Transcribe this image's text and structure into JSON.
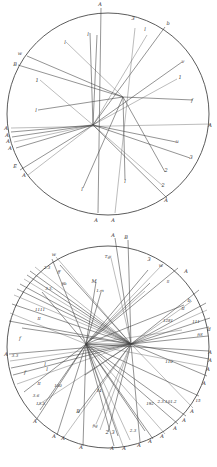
{
  "figure": {
    "width": 217,
    "height": 467,
    "colors": {
      "background": "#ffffff",
      "ink": "#3a3a3a",
      "circle": "#4a4a4a"
    }
  },
  "diagrams": [
    {
      "id": "upper-circle",
      "circle": {
        "cx": 108,
        "cy": 114,
        "r": 101
      },
      "foci": [
        {
          "x": 93,
          "y": 125
        },
        {
          "x": 123,
          "y": 97
        }
      ],
      "chords": [
        [
          101,
          8,
          98,
          213
        ],
        [
          90,
          33,
          93,
          125
        ],
        [
          93,
          125,
          147,
          35
        ],
        [
          93,
          125,
          165,
          27
        ],
        [
          93,
          125,
          182,
          62
        ],
        [
          93,
          125,
          177,
          79
        ],
        [
          27,
          56,
          123,
          97
        ],
        [
          18,
          65,
          123,
          97
        ],
        [
          40,
          80,
          93,
          125
        ],
        [
          38,
          110,
          123,
          97
        ],
        [
          123,
          97,
          193,
          100
        ],
        [
          66,
          42,
          123,
          97
        ],
        [
          123,
          97,
          165,
          172
        ],
        [
          123,
          97,
          125,
          180
        ],
        [
          11,
          128,
          211,
          124
        ],
        [
          11,
          132,
          93,
          125
        ],
        [
          12,
          137,
          93,
          125
        ],
        [
          14,
          142,
          93,
          125
        ],
        [
          16,
          148,
          93,
          125
        ],
        [
          20,
          170,
          93,
          125
        ],
        [
          28,
          175,
          93,
          125
        ],
        [
          93,
          125,
          176,
          142
        ],
        [
          93,
          125,
          190,
          158
        ],
        [
          93,
          125,
          163,
          186
        ],
        [
          93,
          125,
          167,
          198
        ],
        [
          83,
          188,
          123,
          97
        ],
        [
          115,
          213,
          135,
          28
        ],
        [
          93,
          125,
          97,
          35
        ]
      ],
      "labels": [
        {
          "text": "A",
          "x": 100,
          "y": 6
        },
        {
          "text": "3",
          "x": 133,
          "y": 20
        },
        {
          "text": "b",
          "x": 168,
          "y": 25
        },
        {
          "text": "l",
          "x": 88,
          "y": 36
        },
        {
          "text": "l",
          "x": 145,
          "y": 31
        },
        {
          "text": "l",
          "x": 65,
          "y": 44
        },
        {
          "text": "w",
          "x": 20,
          "y": 55
        },
        {
          "text": "B",
          "x": 15,
          "y": 66
        },
        {
          "text": "1",
          "x": 37,
          "y": 82
        },
        {
          "text": "v",
          "x": 183,
          "y": 63
        },
        {
          "text": "1",
          "x": 180,
          "y": 79
        },
        {
          "text": "l",
          "x": 36,
          "y": 112
        },
        {
          "text": "f",
          "x": 192,
          "y": 102
        },
        {
          "text": "A",
          "x": 6,
          "y": 130
        },
        {
          "text": "A",
          "x": 210,
          "y": 127
        },
        {
          "text": "A",
          "x": 7,
          "y": 137
        },
        {
          "text": "A",
          "x": 8,
          "y": 143
        },
        {
          "text": "A",
          "x": 10,
          "y": 150
        },
        {
          "text": "u",
          "x": 177,
          "y": 143
        },
        {
          "text": "3",
          "x": 191,
          "y": 159
        },
        {
          "text": "E",
          "x": 15,
          "y": 168
        },
        {
          "text": "A",
          "x": 24,
          "y": 177
        },
        {
          "text": "2",
          "x": 166,
          "y": 172
        },
        {
          "text": "l",
          "x": 125,
          "y": 183
        },
        {
          "text": "2",
          "x": 163,
          "y": 187
        },
        {
          "text": "l",
          "x": 82,
          "y": 191
        },
        {
          "text": "A",
          "x": 166,
          "y": 202
        },
        {
          "text": "A",
          "x": 96,
          "y": 222
        },
        {
          "text": "A",
          "x": 113,
          "y": 222
        }
      ]
    },
    {
      "id": "lower-circle",
      "circle": {
        "cx": 108,
        "cy": 347,
        "r": 101
      },
      "foci": [
        {
          "x": 86,
          "y": 344
        },
        {
          "x": 131,
          "y": 344
        }
      ],
      "chords": [
        [
          115,
          238,
          131,
          344
        ],
        [
          128,
          240,
          131,
          344
        ],
        [
          56,
          257,
          131,
          344
        ],
        [
          52,
          259,
          86,
          344
        ],
        [
          60,
          265,
          131,
          344
        ],
        [
          35,
          267,
          131,
          344
        ],
        [
          30,
          271,
          131,
          344
        ],
        [
          27,
          275,
          131,
          344
        ],
        [
          24,
          279,
          131,
          344
        ],
        [
          20,
          284,
          131,
          344
        ],
        [
          17,
          289,
          131,
          344
        ],
        [
          14,
          295,
          131,
          344
        ],
        [
          42,
          292,
          86,
          344
        ],
        [
          12,
          304,
          131,
          344
        ],
        [
          10,
          313,
          86,
          344
        ],
        [
          9,
          321,
          131,
          344
        ],
        [
          22,
          328,
          131,
          344
        ],
        [
          111,
          258,
          131,
          344
        ],
        [
          96,
          282,
          86,
          344
        ],
        [
          101,
          292,
          86,
          344
        ],
        [
          163,
          264,
          86,
          344
        ],
        [
          148,
          270,
          86,
          344
        ],
        [
          150,
          283,
          86,
          344
        ],
        [
          145,
          291,
          86,
          344
        ],
        [
          178,
          268,
          86,
          344
        ],
        [
          199,
          290,
          131,
          344
        ],
        [
          192,
          301,
          131,
          344
        ],
        [
          184,
          305,
          86,
          344
        ],
        [
          206,
          303,
          131,
          344
        ],
        [
          207,
          310,
          131,
          344
        ],
        [
          210,
          318,
          131,
          344
        ],
        [
          209,
          327,
          131,
          344
        ],
        [
          182,
          330,
          86,
          344
        ],
        [
          208,
          336,
          131,
          344
        ],
        [
          9,
          354,
          131,
          344
        ],
        [
          10,
          361,
          131,
          344
        ],
        [
          11,
          368,
          131,
          344
        ],
        [
          13,
          375,
          131,
          344
        ],
        [
          17,
          384,
          131,
          344
        ],
        [
          24,
          392,
          86,
          344
        ],
        [
          40,
          410,
          86,
          344
        ],
        [
          38,
          405,
          131,
          344
        ],
        [
          36,
          420,
          86,
          344
        ],
        [
          57,
          435,
          86,
          344
        ],
        [
          64,
          437,
          131,
          344
        ],
        [
          83,
          446,
          86,
          344
        ],
        [
          114,
          446,
          86,
          344
        ],
        [
          123,
          446,
          86,
          344
        ],
        [
          140,
          442,
          131,
          344
        ],
        [
          153,
          439,
          86,
          344
        ],
        [
          165,
          434,
          86,
          344
        ],
        [
          178,
          424,
          86,
          344
        ],
        [
          186,
          416,
          86,
          344
        ],
        [
          193,
          408,
          131,
          344
        ],
        [
          199,
          396,
          86,
          344
        ],
        [
          207,
          376,
          131,
          344
        ],
        [
          208,
          367,
          86,
          344
        ],
        [
          209,
          359,
          131,
          344
        ],
        [
          209,
          351,
          86,
          344
        ],
        [
          96,
          424,
          131,
          344
        ],
        [
          78,
          413,
          131,
          344
        ],
        [
          108,
          432,
          131,
          344
        ],
        [
          130,
          440,
          86,
          344
        ],
        [
          145,
          431,
          86,
          344
        ],
        [
          85,
          375,
          131,
          344
        ],
        [
          100,
          430,
          131,
          344
        ],
        [
          118,
          436,
          86,
          344
        ],
        [
          86,
          344,
          131,
          344
        ]
      ],
      "labels": [
        {
          "text": "A",
          "x": 113,
          "y": 237
        },
        {
          "text": "B",
          "x": 126,
          "y": 239
        },
        {
          "text": "w",
          "x": 54,
          "y": 256
        },
        {
          "text": "Tgi",
          "x": 108,
          "y": 258,
          "small": true
        },
        {
          "text": "2.3",
          "x": 47,
          "y": 269,
          "small": true
        },
        {
          "text": "ff",
          "x": 59,
          "y": 273,
          "small": true
        },
        {
          "text": "3",
          "x": 149,
          "y": 261
        },
        {
          "text": "w",
          "x": 161,
          "y": 267
        },
        {
          "text": "A",
          "x": 186,
          "y": 273
        },
        {
          "text": "fib",
          "x": 64,
          "y": 285,
          "small": true
        },
        {
          "text": "M",
          "x": 94,
          "y": 283
        },
        {
          "text": "3.3.",
          "x": 49,
          "y": 290,
          "small": true
        },
        {
          "text": "ll",
          "x": 168,
          "y": 283,
          "small": true
        },
        {
          "text": "1.m",
          "x": 100,
          "y": 292,
          "small": true
        },
        {
          "text": "b",
          "x": 189,
          "y": 302
        },
        {
          "text": "1111",
          "x": 40,
          "y": 311,
          "small": true
        },
        {
          "text": "II",
          "x": 183,
          "y": 310,
          "small": true
        },
        {
          "text": "II",
          "x": 39,
          "y": 320,
          "small": true
        },
        {
          "text": "1281",
          "x": 168,
          "y": 322,
          "small": true
        },
        {
          "text": "111",
          "x": 196,
          "y": 323,
          "small": true
        },
        {
          "text": "f",
          "x": 20,
          "y": 340
        },
        {
          "text": "d",
          "x": 209,
          "y": 331
        },
        {
          "text": "fiS",
          "x": 200,
          "y": 336,
          "small": true
        },
        {
          "text": "A",
          "x": 6,
          "y": 356
        },
        {
          "text": "3.3",
          "x": 15,
          "y": 357,
          "small": true
        },
        {
          "text": "l",
          "x": 45,
          "y": 366
        },
        {
          "text": "l",
          "x": 47,
          "y": 371
        },
        {
          "text": "f",
          "x": 25,
          "y": 374
        },
        {
          "text": "110",
          "x": 169,
          "y": 363,
          "small": true
        },
        {
          "text": "II",
          "x": 39,
          "y": 385,
          "small": true
        },
        {
          "text": "100",
          "x": 58,
          "y": 387,
          "small": true
        },
        {
          "text": "3.6",
          "x": 36,
          "y": 397,
          "small": true
        },
        {
          "text": "14",
          "x": 99,
          "y": 392,
          "small": true
        },
        {
          "text": "13.3.",
          "x": 41,
          "y": 405,
          "small": true
        },
        {
          "text": "192",
          "x": 150,
          "y": 405,
          "small": true
        },
        {
          "text": "2.3.101.2",
          "x": 167,
          "y": 403,
          "small": true
        },
        {
          "text": "B",
          "x": 78,
          "y": 413
        },
        {
          "text": "fig",
          "x": 95,
          "y": 427,
          "small": true
        },
        {
          "text": "2",
          "x": 107,
          "y": 434
        },
        {
          "text": "3",
          "x": 113,
          "y": 434
        },
        {
          "text": "2.3",
          "x": 133,
          "y": 432,
          "small": true
        },
        {
          "text": "A",
          "x": 35,
          "y": 423
        },
        {
          "text": "A",
          "x": 54,
          "y": 438
        },
        {
          "text": "A",
          "x": 63,
          "y": 440
        },
        {
          "text": "A",
          "x": 81,
          "y": 449
        },
        {
          "text": "A",
          "x": 112,
          "y": 450
        },
        {
          "text": "A",
          "x": 124,
          "y": 450
        },
        {
          "text": "A",
          "x": 139,
          "y": 447
        },
        {
          "text": "A",
          "x": 150,
          "y": 443
        },
        {
          "text": "A",
          "x": 162,
          "y": 438
        },
        {
          "text": "A",
          "x": 175,
          "y": 430
        },
        {
          "text": "A",
          "x": 184,
          "y": 422
        },
        {
          "text": "A",
          "x": 192,
          "y": 413
        },
        {
          "text": "15",
          "x": 198,
          "y": 402,
          "small": true
        },
        {
          "text": "A",
          "x": 204,
          "y": 385
        },
        {
          "text": "A",
          "x": 208,
          "y": 371
        },
        {
          "text": "A",
          "x": 210,
          "y": 362
        },
        {
          "text": "A",
          "x": 210,
          "y": 354
        }
      ]
    }
  ]
}
